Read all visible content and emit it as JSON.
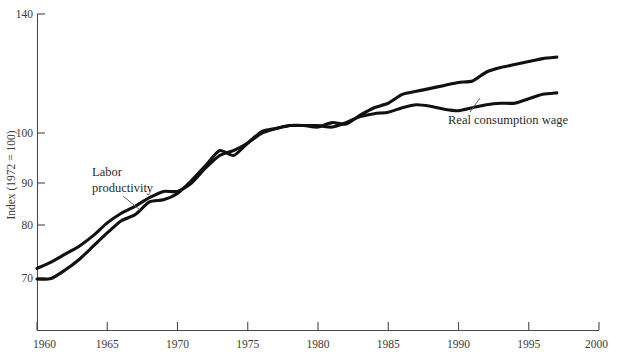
{
  "chart_data": {
    "type": "line",
    "title": "",
    "subtitle": "",
    "xlabel": "",
    "ylabel": "Index (1972 = 100)",
    "grid": false,
    "legend_position": "inline-annotations",
    "xlim": [
      1960,
      2000
    ],
    "ylim": [
      62,
      140
    ],
    "x_ticks": [
      1960,
      1965,
      1970,
      1975,
      1980,
      1985,
      1990,
      1995,
      2000
    ],
    "x_tick_labels": [
      "1960",
      "1965",
      "1970",
      "1975",
      "1980",
      "1985",
      "1990",
      "1995",
      "2000"
    ],
    "y_ticks": [
      70,
      80,
      90,
      100,
      140
    ],
    "y_tick_labels": [
      "70",
      "80",
      "90",
      "100",
      "140"
    ],
    "y_axis_note": "non-linear (ratio/compressed) vertical scale; spacing between 100 and 140 is condensed",
    "annotations": [
      {
        "text": "Labor productivity",
        "x": 1966.5,
        "y": 93,
        "points_to_x": 1967.0,
        "points_to_y": 85.5
      },
      {
        "text": "Real consumption wage",
        "x": 1990.0,
        "y": 110,
        "points_to_x": 1990.6,
        "points_to_y": 116.5
      }
    ],
    "series": [
      {
        "name": "Labor productivity",
        "color": "#111111",
        "x": [
          1960,
          1961,
          1962,
          1963,
          1964,
          1965,
          1966,
          1967,
          1968,
          1969,
          1970,
          1971,
          1972,
          1973,
          1974,
          1975,
          1976,
          1977,
          1978,
          1979,
          1980,
          1981,
          1982,
          1983,
          1984,
          1985,
          1986,
          1987,
          1988,
          1989,
          1990,
          1991,
          1992,
          1993,
          1994,
          1995,
          1996,
          1997
        ],
        "values": [
          69.8,
          69.9,
          71.5,
          73.5,
          76.0,
          78.5,
          81.0,
          82.5,
          85.5,
          86.0,
          87.5,
          90.5,
          93.5,
          96.5,
          95.5,
          98.0,
          100.5,
          101.5,
          102.5,
          102.5,
          102.0,
          103.5,
          103.0,
          106.0,
          108.5,
          110.0,
          113.0,
          114.0,
          115.0,
          116.0,
          117.0,
          117.5,
          120.5,
          122.0,
          123.0,
          124.0,
          125.0,
          125.5
        ]
      },
      {
        "name": "Real consumption wage",
        "color": "#111111",
        "x": [
          1960,
          1961,
          1962,
          1963,
          1964,
          1965,
          1966,
          1967,
          1968,
          1969,
          1970,
          1971,
          1972,
          1973,
          1974,
          1975,
          1976,
          1977,
          1978,
          1979,
          1980,
          1981,
          1982,
          1983,
          1984,
          1985,
          1986,
          1987,
          1988,
          1989,
          1990,
          1991,
          1992,
          1993,
          1994,
          1995,
          1996,
          1997
        ],
        "values": [
          71.8,
          73.0,
          74.5,
          76.0,
          78.0,
          80.5,
          82.8,
          84.5,
          86.5,
          88.0,
          88.0,
          90.0,
          93.0,
          95.5,
          96.5,
          98.0,
          100.0,
          101.5,
          102.5,
          102.5,
          102.5,
          102.0,
          103.5,
          105.5,
          106.5,
          107.0,
          108.5,
          109.5,
          109.0,
          108.0,
          107.5,
          108.5,
          109.5,
          110.0,
          110.0,
          111.5,
          113.0,
          113.5
        ]
      }
    ]
  },
  "axis": {
    "y_title": "Index (1972 = 100)",
    "y_labels": [
      "140",
      "100",
      "90",
      "80",
      "70"
    ],
    "x_labels": [
      "1960",
      "1965",
      "1970",
      "1975",
      "1980",
      "1985",
      "1990",
      "1995",
      "2000"
    ]
  },
  "annotations": {
    "labor_productivity_line1": "Labor",
    "labor_productivity_line2": "productivity",
    "real_consumption_wage": "Real consumption wage"
  },
  "colors": {
    "series": "#111111",
    "axis": "#4a4a4a",
    "text": "#3b3b3b",
    "background": "#ffffff"
  }
}
